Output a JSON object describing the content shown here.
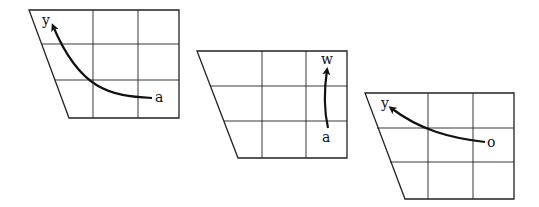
{
  "panels": [
    {
      "start_label": "a",
      "end_label": "y"
    },
    {
      "start_label": "a",
      "end_label": "w"
    },
    {
      "start_label": "o",
      "end_label": "y"
    }
  ]
}
